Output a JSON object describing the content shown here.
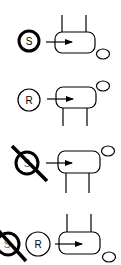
{
  "diagram": {
    "figures": [
      {
        "id": "stimulus-present",
        "circle_label": "S",
        "crossed": false,
        "legs": "up",
        "head": "bottom-right"
      },
      {
        "id": "response",
        "circle_label": "R",
        "crossed": false,
        "legs": "down",
        "head": "top-right"
      },
      {
        "id": "stimulus-absent",
        "circle_label": "S",
        "crossed": true,
        "legs": "down",
        "head": "top-right"
      },
      {
        "id": "no-stimulus-response",
        "circle_labels": [
          "S",
          "R"
        ],
        "crossed_first": true,
        "legs": "up",
        "head": "bottom-right"
      }
    ],
    "labels": {
      "s1": "S",
      "r2": "R",
      "s3": "S",
      "s4": "S",
      "r4": "R"
    },
    "colors": {
      "ink": "#000000",
      "background": "#ffffff"
    }
  }
}
